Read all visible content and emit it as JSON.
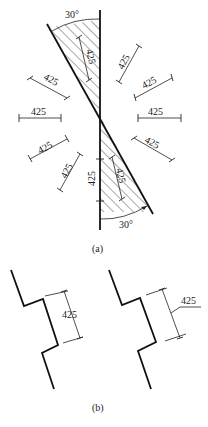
{
  "figure_a": {
    "caption": "(a)",
    "angle_top": "30°",
    "angle_bottom": "30°",
    "dimension_value": "425",
    "dimensions": [
      {
        "position": "top-hatch-inner",
        "label": "425"
      },
      {
        "position": "upper-right-steep",
        "label": "425"
      },
      {
        "position": "right-upper",
        "label": "425"
      },
      {
        "position": "right-horizontal",
        "label": "425"
      },
      {
        "position": "right-lower",
        "label": "425"
      },
      {
        "position": "upper-left",
        "label": "425"
      },
      {
        "position": "left-horizontal",
        "label": "425"
      },
      {
        "position": "lower-left",
        "label": "425"
      },
      {
        "position": "lower-left-steep",
        "label": "425"
      },
      {
        "position": "vertical-left-of-axis",
        "label": "425"
      },
      {
        "position": "bottom-hatch-inner",
        "label": "425"
      }
    ]
  },
  "figure_b": {
    "caption": "(b)",
    "left_dimension": "425",
    "right_dimension": "425"
  }
}
